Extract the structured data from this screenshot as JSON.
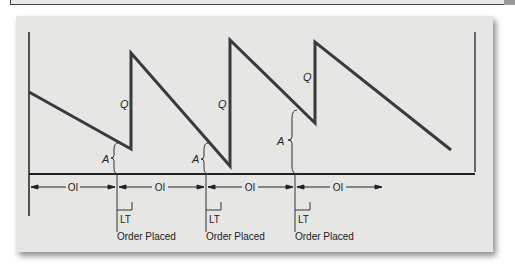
{
  "diagram": {
    "title": "",
    "labels": {
      "q": "Q",
      "a": "A",
      "oi": "OI",
      "lt": "LT",
      "order_placed": "Order Placed"
    },
    "intervals": [
      {
        "label": "OI"
      },
      {
        "label": "OI"
      },
      {
        "label": "OI"
      },
      {
        "label": "OI"
      }
    ],
    "order_events": [
      {
        "lt_label": "LT",
        "label": "Order Placed"
      },
      {
        "lt_label": "LT",
        "label": "Order Placed"
      },
      {
        "lt_label": "LT",
        "label": "Order Placed"
      }
    ],
    "colors": {
      "line": "#3a3a3a",
      "panel_bg": "#e6e6e4",
      "text": "#222222"
    }
  }
}
